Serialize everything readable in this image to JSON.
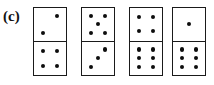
{
  "figure": {
    "panel_label": "(c)",
    "ink_color": "#1a1a1a",
    "pip_color": "#0d0d0d",
    "background_color": "#ffffff"
  },
  "dominoes": [
    {
      "index": 1,
      "name": "domino-2-4",
      "top_pips": 2,
      "bottom_pips": 4,
      "top_layout": "anti-diagonal",
      "bottom_layout": "square"
    },
    {
      "index": 2,
      "name": "domino-5-3",
      "top_pips": 5,
      "bottom_pips": 3,
      "top_layout": "quincunx",
      "bottom_layout": "anti-diagonal"
    },
    {
      "index": 3,
      "name": "domino-4-6",
      "top_pips": 4,
      "bottom_pips": 6,
      "top_layout": "square",
      "bottom_layout": "two-by-three"
    },
    {
      "index": 4,
      "name": "domino-1-6",
      "top_pips": 1,
      "bottom_pips": 6,
      "top_layout": "center",
      "bottom_layout": "two-by-three"
    }
  ]
}
